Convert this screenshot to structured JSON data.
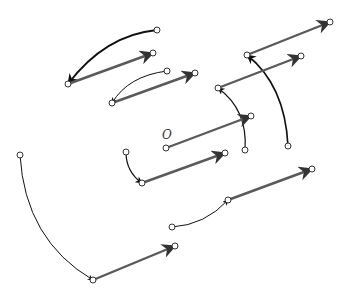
{
  "diagram": {
    "title": "",
    "origin_label": "O",
    "colors": {
      "vector": "#5a5a5a",
      "curve": "#111111",
      "point_stroke": "#333333",
      "background": "#ffffff"
    },
    "vectors": [
      {
        "from": [
          68,
          84
        ],
        "to": [
          153,
          53
        ]
      },
      {
        "from": [
          112,
          103
        ],
        "to": [
          195,
          73
        ]
      },
      {
        "from": [
          247,
          55
        ],
        "to": [
          330,
          22
        ]
      },
      {
        "from": [
          218,
          88
        ],
        "to": [
          301,
          56
        ]
      },
      {
        "from": [
          166,
          148
        ],
        "to": [
          251,
          116
        ]
      },
      {
        "from": [
          142,
          183
        ],
        "to": [
          225,
          153
        ]
      },
      {
        "from": [
          228,
          200
        ],
        "to": [
          312,
          169
        ]
      },
      {
        "from": [
          93,
          280
        ],
        "to": [
          175,
          246
        ]
      }
    ],
    "curves": [
      {
        "from": [
          157,
          30
        ],
        "to": [
          68,
          84
        ],
        "ctrl": [
          105,
          35
        ],
        "width": 1.8
      },
      {
        "from": [
          167,
          71
        ],
        "to": [
          112,
          103
        ],
        "ctrl": [
          128,
          76
        ],
        "width": 1
      },
      {
        "from": [
          288,
          146
        ],
        "to": [
          247,
          55
        ],
        "ctrl": [
          285,
          85
        ],
        "width": 1.6
      },
      {
        "from": [
          245,
          150
        ],
        "to": [
          218,
          88
        ],
        "ctrl": [
          248,
          110
        ],
        "width": 1.2
      },
      {
        "from": [
          126,
          152
        ],
        "to": [
          142,
          183
        ],
        "ctrl": [
          126,
          172
        ],
        "width": 1.2
      },
      {
        "from": [
          172,
          227
        ],
        "to": [
          228,
          200
        ],
        "ctrl": [
          205,
          225
        ],
        "width": 1
      },
      {
        "from": [
          20,
          155
        ],
        "to": [
          93,
          280
        ],
        "ctrl": [
          25,
          240
        ],
        "width": 1
      }
    ]
  }
}
